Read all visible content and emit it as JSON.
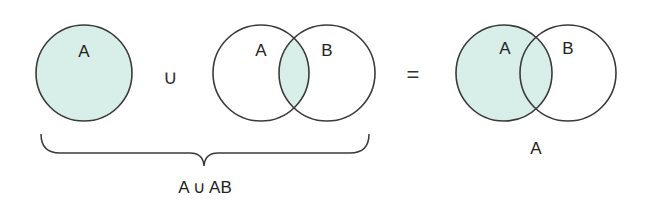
{
  "diagram": {
    "fill_color": "#d8efe9",
    "stroke_color": "#3a3a3a",
    "panel1": {
      "label_a": "A"
    },
    "operator_union": "∪",
    "panel2": {
      "label_a": "A",
      "label_b": "B"
    },
    "operator_equals": "=",
    "panel3": {
      "label_a": "A",
      "label_b": "B",
      "caption": "A"
    },
    "brace_caption": "A ∪ AB"
  }
}
